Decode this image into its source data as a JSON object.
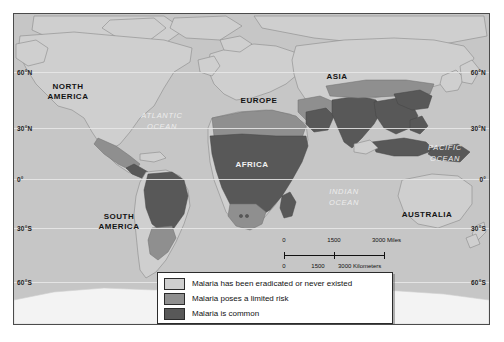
{
  "map": {
    "title": "World malaria risk map",
    "background_color": "#ffffff",
    "ocean_color": "#c6c6c6",
    "frame_border_color": "#4b4b4b",
    "latitude_labels_left": [
      {
        "label": "60°N",
        "top": 55
      },
      {
        "label": "30°N",
        "top": 111
      },
      {
        "label": "0°",
        "top": 162
      },
      {
        "label": "30°S",
        "top": 211
      },
      {
        "label": "60°S",
        "top": 265
      }
    ],
    "latitude_labels_right": [
      {
        "label": "60°N",
        "top": 55
      },
      {
        "label": "30°N",
        "top": 111
      },
      {
        "label": "0°",
        "top": 162
      },
      {
        "label": "30°S",
        "top": 211
      },
      {
        "label": "60°S",
        "top": 265
      }
    ],
    "graticule_tops": [
      58,
      114,
      165,
      214,
      268
    ],
    "continent_labels": [
      {
        "name": "north-america",
        "text": "NORTH\nAMERICA",
        "left": 14,
        "top": 68,
        "width": 80,
        "style": "dark"
      },
      {
        "name": "europe",
        "text": "EUROPE",
        "left": 216,
        "top": 82,
        "width": 58,
        "style": "dark"
      },
      {
        "name": "asia",
        "text": "ASIA",
        "left": 300,
        "top": 58,
        "width": 46,
        "style": "dark"
      },
      {
        "name": "africa",
        "text": "AFRICA",
        "left": 208,
        "top": 146,
        "width": 60,
        "style": "light"
      },
      {
        "name": "south-america",
        "text": "SOUTH\nAMERICA",
        "left": 64,
        "top": 198,
        "width": 82,
        "style": "dark"
      },
      {
        "name": "australia",
        "text": "AUSTRALIA",
        "left": 377,
        "top": 196,
        "width": 72,
        "style": "dark"
      }
    ],
    "ocean_labels": [
      {
        "name": "atlantic-ocean",
        "text": "ATLANTIC\nOCEAN",
        "left": 110,
        "top": 96,
        "width": 76
      },
      {
        "name": "pacific-ocean",
        "text": "PACIFIC\nOCEAN",
        "left": 395,
        "top": 128,
        "width": 72
      },
      {
        "name": "indian-ocean",
        "text": "INDIAN\nOCEAN",
        "left": 295,
        "top": 172,
        "width": 70
      }
    ]
  },
  "scalebar": {
    "miles": {
      "unit_label": "3000 Miles",
      "ticks": [
        "0",
        "1500"
      ]
    },
    "kilometers": {
      "unit_label": "3000 Kilometers",
      "ticks": [
        "0",
        "1500"
      ]
    }
  },
  "legend": {
    "items": [
      {
        "name": "eradicated",
        "label": "Malaria has been eradicated or never existed",
        "color": "#cfcfcf"
      },
      {
        "name": "limited-risk",
        "label": "Malaria poses a limited risk",
        "color": "#8f8f8f"
      },
      {
        "name": "common",
        "label": "Malaria is common",
        "color": "#585858"
      }
    ]
  },
  "colors": {
    "eradicated": "#cfcfcf",
    "limited_risk": "#8f8f8f",
    "common": "#585858",
    "ocean": "#c6c6c6",
    "land_outline": "#8a8a8a",
    "graticule": "#ededed"
  }
}
